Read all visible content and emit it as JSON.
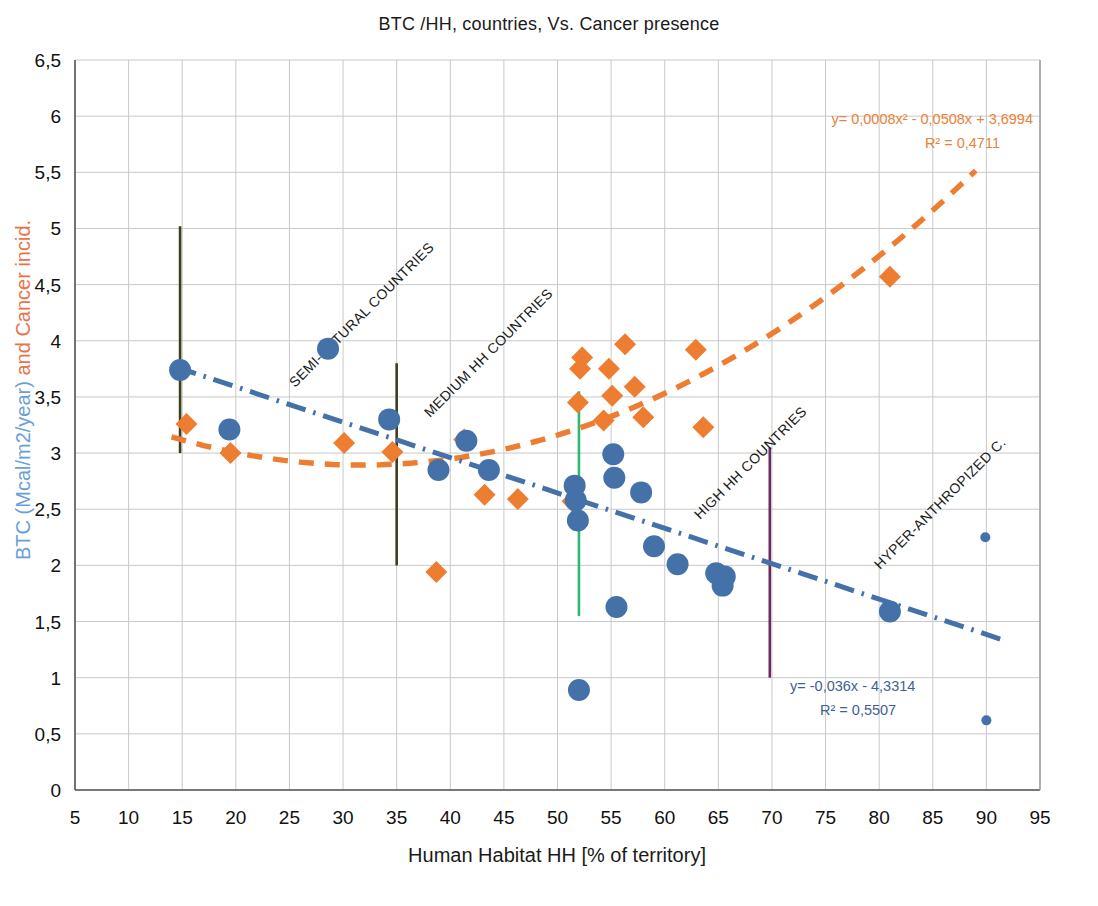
{
  "chart_data": {
    "type": "scatter",
    "title": "BTC /HH, countries, Vs. Cancer presence",
    "xlabel": "Human Habitat HH [% of territory]",
    "ylabel_blue": "BTC (Mcal/m2/year)",
    "ylabel_orange": " and Cancer incid.",
    "xlim": [
      5,
      95
    ],
    "ylim": [
      0,
      6.5
    ],
    "xticks": [
      "5",
      "10",
      "15",
      "20",
      "25",
      "30",
      "35",
      "40",
      "45",
      "50",
      "55",
      "60",
      "65",
      "70",
      "75",
      "80",
      "85",
      "90",
      "95"
    ],
    "yticks": [
      "0",
      "0,5",
      "1",
      "1,5",
      "2",
      "2,5",
      "3",
      "3,5",
      "4",
      "4,5",
      "5",
      "5,5",
      "6",
      "6,5"
    ],
    "grid": true,
    "legend": "none",
    "series": [
      {
        "name": "BTC (Mcal/m2/year)",
        "marker": "circle",
        "color": "#4472a8",
        "points": [
          [
            14.8,
            3.74
          ],
          [
            19.4,
            3.21
          ],
          [
            28.6,
            3.93
          ],
          [
            34.3,
            3.3
          ],
          [
            38.9,
            2.85
          ],
          [
            41.5,
            3.11
          ],
          [
            43.6,
            2.85
          ],
          [
            51.6,
            2.71
          ],
          [
            51.7,
            2.58
          ],
          [
            51.9,
            2.4
          ],
          [
            52.0,
            0.89
          ],
          [
            55.2,
            2.99
          ],
          [
            55.3,
            2.78
          ],
          [
            55.5,
            1.63
          ],
          [
            57.8,
            2.65
          ],
          [
            59.0,
            2.17
          ],
          [
            61.2,
            2.01
          ],
          [
            64.8,
            1.93
          ],
          [
            65.6,
            1.9
          ],
          [
            65.4,
            1.82
          ],
          [
            81.0,
            1.59
          ],
          [
            89.9,
            2.25
          ],
          [
            90.0,
            0.62
          ]
        ]
      },
      {
        "name": "Cancer incid.",
        "marker": "diamond",
        "color": "#ed7d31",
        "points": [
          [
            15.4,
            3.26
          ],
          [
            19.5,
            3.0
          ],
          [
            30.1,
            3.09
          ],
          [
            34.6,
            3.01
          ],
          [
            38.7,
            1.94
          ],
          [
            41.3,
            3.12
          ],
          [
            43.2,
            2.63
          ],
          [
            46.3,
            2.59
          ],
          [
            51.4,
            2.57
          ],
          [
            51.9,
            3.45
          ],
          [
            52.1,
            3.75
          ],
          [
            52.3,
            3.85
          ],
          [
            54.3,
            3.29
          ],
          [
            54.8,
            3.75
          ],
          [
            55.1,
            3.51
          ],
          [
            56.3,
            3.97
          ],
          [
            57.2,
            3.59
          ],
          [
            58.0,
            3.32
          ],
          [
            62.9,
            3.92
          ],
          [
            63.6,
            3.23
          ],
          [
            81.0,
            4.57
          ]
        ]
      }
    ],
    "trendlines": [
      {
        "name": "orange-polynomial-trend",
        "color": "#ed7d31",
        "style": "dashed",
        "equation": "y= 0,0008x2 - 0,0508x + 3,6994",
        "equation_display": "y= 0,0008x² - 0,0508x + 3,6994",
        "r2": "R² = 0,4711",
        "coefficients": {
          "a": 0.0008,
          "b": -0.0508,
          "c": 3.6994
        },
        "x_range": [
          14,
          90
        ]
      },
      {
        "name": "blue-linear-trend",
        "color": "#4472a8",
        "style": "dash-dot",
        "equation": "y= -0,036x - 4,3314",
        "equation_display": "y= -0,036x - 4,3314",
        "r2": "R² = 0,5507",
        "plotted_slope": -0.0315,
        "plotted_intercept": 4.22,
        "x_range": [
          14.5,
          92
        ]
      }
    ],
    "zones": [
      {
        "label": "SEMI-NATURAL COUNTRIES",
        "label_x": 295,
        "label_y": 388,
        "rotation": -45
      },
      {
        "label": "MEDIUM HH COUNTRIES",
        "label_x": 430,
        "label_y": 418,
        "rotation": -45
      },
      {
        "label": "HIGH HH COUNTRIES",
        "label_x": 700,
        "label_y": 520,
        "rotation": -45
      },
      {
        "label": "HYPER-ANTHROPIZED C.",
        "label_x": 880,
        "label_y": 570,
        "rotation": -45
      }
    ],
    "dividers": [
      {
        "name": "divider-semi-natural",
        "x": 14.8,
        "y_from": 3.0,
        "y_to": 5.02,
        "color": "#3d3d1f"
      },
      {
        "name": "divider-medium-hh",
        "x": 35.0,
        "y_from": 2.0,
        "y_to": 3.8,
        "color": "#3d3d1f"
      },
      {
        "name": "divider-high-hh",
        "x": 52.0,
        "y_from": 1.55,
        "y_to": 3.55,
        "color": "#2eb872"
      },
      {
        "name": "divider-hyper-anthropized",
        "x": 69.8,
        "y_from": 1.0,
        "y_to": 3.05,
        "color": "#6b2a5e"
      }
    ]
  }
}
